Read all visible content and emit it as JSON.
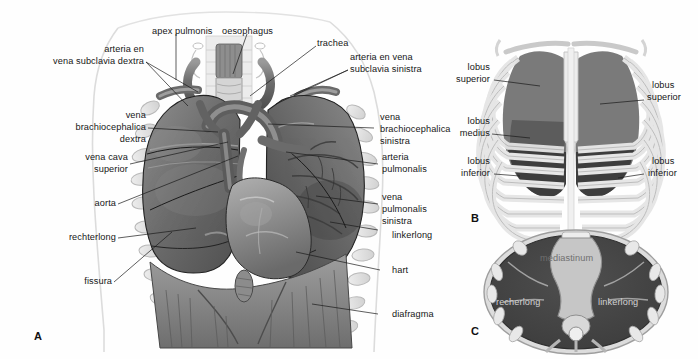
{
  "figure": {
    "background": "#fefefe",
    "panels": [
      {
        "letter": "A",
        "caption": "Ventraal aanzicht van de thorax met longen, hart en grote vaten"
      },
      {
        "letter": "B",
        "caption": "Projectie van de longkwabben op de ribbenkast"
      },
      {
        "letter": "C",
        "caption": "Transversale doorsnede van de thorax"
      }
    ]
  },
  "panel_a": {
    "letter": "A",
    "labels": [
      {
        "id": "apex-pulmonis",
        "text": "apex pulmonis",
        "align": "left"
      },
      {
        "id": "oesophagus",
        "text": "oesophagus",
        "align": "left"
      },
      {
        "id": "trachea",
        "text": "trachea",
        "align": "left"
      },
      {
        "id": "arteria-en",
        "text": "arteria en",
        "align": "right"
      },
      {
        "id": "vena-subclavia-dextra",
        "text": "vena subclavia dextra",
        "align": "right"
      },
      {
        "id": "arteria-en-vena",
        "text": "arteria en vena",
        "align": "left"
      },
      {
        "id": "subclavia-sinistra",
        "text": "subclavia sinistra",
        "align": "left"
      },
      {
        "id": "vena-dextra-1",
        "text": "vena",
        "align": "right"
      },
      {
        "id": "vena-dextra-2",
        "text": "brachiocephalica",
        "align": "right"
      },
      {
        "id": "vena-dextra-3",
        "text": "dextra",
        "align": "right"
      },
      {
        "id": "vena-cava-1",
        "text": "vena cava",
        "align": "right"
      },
      {
        "id": "vena-cava-2",
        "text": "superior",
        "align": "right"
      },
      {
        "id": "aorta",
        "text": "aorta",
        "align": "right"
      },
      {
        "id": "rechterlong",
        "text": "rechterlong",
        "align": "right"
      },
      {
        "id": "fissura",
        "text": "fissura",
        "align": "right"
      },
      {
        "id": "vena-sinistra-1",
        "text": "vena",
        "align": "left"
      },
      {
        "id": "vena-sinistra-2",
        "text": "brachiocephalica",
        "align": "left"
      },
      {
        "id": "vena-sinistra-3",
        "text": "sinistra",
        "align": "left"
      },
      {
        "id": "arteria-pulmonalis-1",
        "text": "arteria",
        "align": "left"
      },
      {
        "id": "arteria-pulmonalis-2",
        "text": "pulmonalis",
        "align": "left"
      },
      {
        "id": "vena-pulmonalis-1",
        "text": "vena",
        "align": "left"
      },
      {
        "id": "vena-pulmonalis-2",
        "text": "pulmonalis",
        "align": "left"
      },
      {
        "id": "vena-pulmonalis-3",
        "text": "sinistra",
        "align": "left"
      },
      {
        "id": "linkerlong",
        "text": "linkerlong",
        "align": "left"
      },
      {
        "id": "hart",
        "text": "hart",
        "align": "left"
      },
      {
        "id": "diafragma",
        "text": "diafragma",
        "align": "left"
      }
    ]
  },
  "panel_b": {
    "letter": "B",
    "labels": [
      {
        "id": "b-left-superior-1",
        "text": "lobus",
        "align": "right"
      },
      {
        "id": "b-left-superior-2",
        "text": "superior",
        "align": "right"
      },
      {
        "id": "b-left-medius-1",
        "text": "lobus",
        "align": "right"
      },
      {
        "id": "b-left-medius-2",
        "text": "medius",
        "align": "right"
      },
      {
        "id": "b-left-inferior-1",
        "text": "lobus",
        "align": "right"
      },
      {
        "id": "b-left-inferior-2",
        "text": "inferior",
        "align": "right"
      },
      {
        "id": "b-right-superior-1",
        "text": "lobus",
        "align": "left"
      },
      {
        "id": "b-right-superior-2",
        "text": "superior",
        "align": "left"
      },
      {
        "id": "b-right-inferior-1",
        "text": "lobus",
        "align": "left"
      },
      {
        "id": "b-right-inferior-2",
        "text": "inferior",
        "align": "left"
      }
    ]
  },
  "panel_c": {
    "letter": "C",
    "labels": [
      {
        "id": "mediastinum",
        "text": "mediastinum"
      },
      {
        "id": "c-recherlong",
        "text": "recherlong"
      },
      {
        "id": "c-linkerlong",
        "text": "linkerlong"
      }
    ]
  },
  "colors": {
    "ink": "#161616",
    "leader": "#1a1a1a",
    "body_outline": "#d8d8d8",
    "rib_light": "#e7e7e7",
    "rib_stroke": "#b4b4b4",
    "lung_dark": "#4c4c4c",
    "lung_mid": "#6e6e6e",
    "lung_light": "#9a9a9a",
    "vessel_dark": "#5a5a5a",
    "vessel_mid": "#7d7d7d",
    "mediastinum": "#c3c3c3",
    "lobe_superior": "#8a8a8a",
    "lobe_medius": "#6b6b6b",
    "lobe_inferior": "#3f3f3f"
  }
}
